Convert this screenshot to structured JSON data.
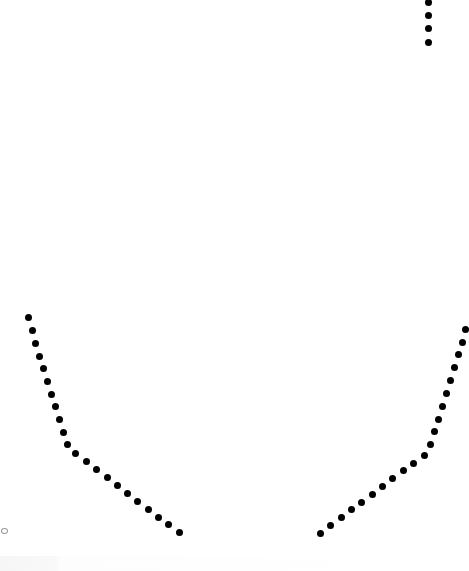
{
  "canvas": {
    "width": 466,
    "height": 571,
    "background": "#ffffff",
    "dot_color": "#000000",
    "dot_size": 7
  },
  "paths": [
    {
      "name": "top-right-vertical-dots",
      "points": [
        [
          428,
          2
        ],
        [
          428,
          15
        ],
        [
          428,
          28
        ],
        [
          428,
          42
        ]
      ]
    },
    {
      "name": "left-arc-dots",
      "points": [
        [
          28,
          317
        ],
        [
          32,
          330
        ],
        [
          35,
          343
        ],
        [
          39,
          356
        ],
        [
          43,
          368
        ],
        [
          47,
          381
        ],
        [
          51,
          394
        ],
        [
          55,
          406
        ],
        [
          59,
          419
        ],
        [
          63,
          432
        ],
        [
          67,
          444
        ],
        [
          75,
          453
        ],
        [
          86,
          461
        ],
        [
          96,
          469
        ],
        [
          107,
          477
        ],
        [
          117,
          485
        ],
        [
          127,
          493
        ],
        [
          137,
          501
        ],
        [
          148,
          509
        ],
        [
          158,
          517
        ],
        [
          168,
          524
        ],
        [
          179,
          532
        ]
      ]
    },
    {
      "name": "right-arc-dots",
      "points": [
        [
          465,
          329
        ],
        [
          462,
          342
        ],
        [
          458,
          354
        ],
        [
          454,
          367
        ],
        [
          450,
          380
        ],
        [
          446,
          393
        ],
        [
          442,
          406
        ],
        [
          438,
          419
        ],
        [
          434,
          431
        ],
        [
          430,
          444
        ],
        [
          424,
          455
        ],
        [
          413,
          463
        ],
        [
          403,
          470
        ],
        [
          392,
          478
        ],
        [
          382,
          486
        ],
        [
          372,
          494
        ],
        [
          361,
          502
        ],
        [
          351,
          509
        ],
        [
          341,
          517
        ],
        [
          330,
          525
        ],
        [
          320,
          533
        ]
      ]
    }
  ],
  "markers": [
    {
      "name": "hollow-ring-marker",
      "x": 3,
      "y": 530
    }
  ]
}
